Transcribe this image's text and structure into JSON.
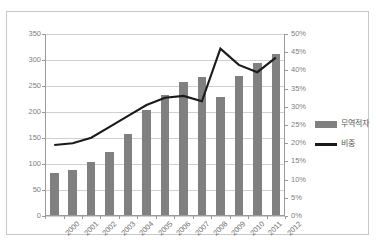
{
  "header": {
    "top_text": ""
  },
  "legend": {
    "position": "right",
    "items": [
      {
        "label": "무역적자",
        "marker": "bar-swatch",
        "color": "#808080"
      },
      {
        "label": "비중",
        "marker": "line-swatch",
        "color": "#1a1a1a"
      }
    ]
  },
  "axes": {
    "left_ticks": [
      "350",
      "300",
      "250",
      "200",
      "150",
      "100",
      "50",
      "0"
    ],
    "right_ticks": [
      "50%",
      "45%",
      "40%",
      "35%",
      "30%",
      "25%",
      "20%",
      "15%",
      "10%",
      "5%",
      "0%"
    ]
  },
  "chart_data": {
    "type": "bar",
    "title": "",
    "subtitle": "",
    "xlabel": "",
    "ylabel": "",
    "y2label": "",
    "grid": true,
    "legend_position": "right",
    "categories": [
      "2000",
      "2001",
      "2002",
      "2003",
      "2004",
      "2005",
      "2006",
      "2007",
      "2008",
      "2009",
      "2010",
      "2011",
      "2012"
    ],
    "ylim": [
      0,
      350
    ],
    "ytick_step": 50,
    "y2lim": [
      0,
      50
    ],
    "y2tick_step": 5,
    "series": [
      {
        "name": "무역적자",
        "type": "bar",
        "axis": "left",
        "color": "#808080",
        "values": [
          82,
          88,
          103,
          123,
          158,
          204,
          232,
          258,
          268,
          228,
          270,
          295,
          312
        ]
      },
      {
        "name": "비중",
        "type": "line",
        "axis": "right",
        "color": "#1a1a1a",
        "unit": "%",
        "values": [
          19.5,
          20.0,
          21.5,
          24.5,
          27.5,
          30.5,
          32.5,
          33.0,
          31.5,
          46.0,
          41.5,
          39.5,
          43.5
        ]
      }
    ]
  }
}
